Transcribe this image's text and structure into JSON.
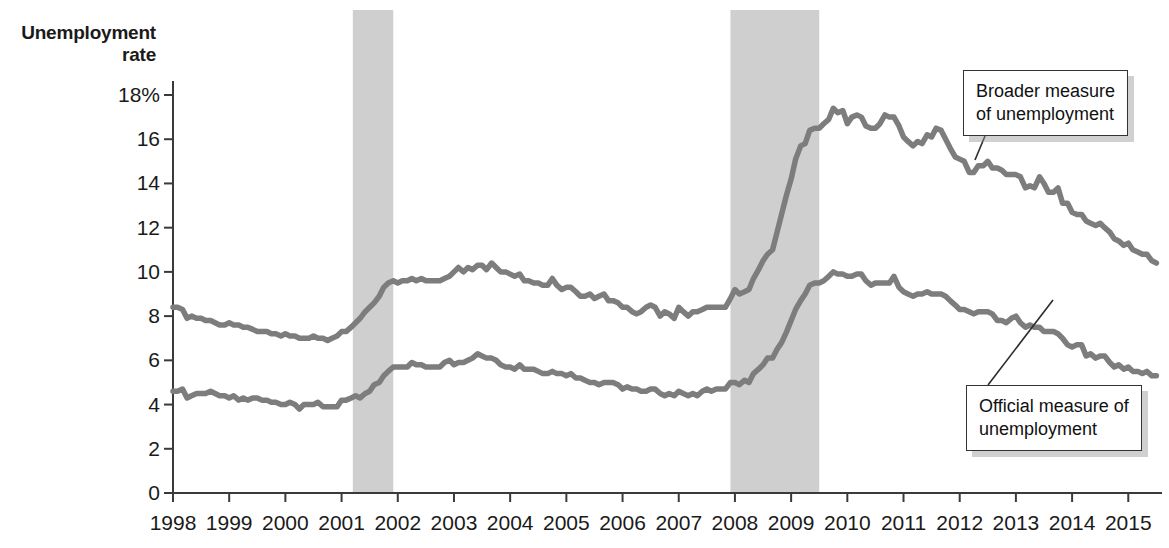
{
  "chart_data": {
    "type": "line",
    "title": "",
    "ylabel": "Unemployment\nrate",
    "xlabel": "",
    "ylim": [
      0,
      18
    ],
    "xlim": [
      1998.0,
      2015.6
    ],
    "grid": false,
    "legend_position": "annotations",
    "y_ticks": [
      "0",
      "2",
      "4",
      "6",
      "8",
      "10",
      "12",
      "14",
      "16",
      "18%"
    ],
    "y_tick_values": [
      0,
      2,
      4,
      6,
      8,
      10,
      12,
      14,
      16,
      18
    ],
    "x_ticks": [
      "1998",
      "1999",
      "2000",
      "2001",
      "2002",
      "2003",
      "2004",
      "2005",
      "2006",
      "2007",
      "2008",
      "2009",
      "2010",
      "2011",
      "2012",
      "2013",
      "2014",
      "2015"
    ],
    "x_tick_values": [
      1998,
      1999,
      2000,
      2001,
      2002,
      2003,
      2004,
      2005,
      2006,
      2007,
      2008,
      2009,
      2010,
      2011,
      2012,
      2013,
      2014,
      2015
    ],
    "line_color": "#7d7d7d",
    "shading_color": "#cfcfcf",
    "axis_color": "#3a3a3a",
    "recession_bands": [
      {
        "start": 2001.2,
        "end": 2001.92,
        "label": "2001 recession"
      },
      {
        "start": 2007.92,
        "end": 2009.5,
        "label": "2007-2009 recession"
      }
    ],
    "annotations": [
      {
        "name": "broader-measure",
        "text": "Broader measure\nof unemployment",
        "box_x": 963,
        "box_y": 70,
        "point_x": 975,
        "point_y": 160
      },
      {
        "name": "official-measure",
        "text": "Official measure of\nunemployment",
        "box_x": 966,
        "box_y": 385,
        "point_x": 1053,
        "point_y": 300
      }
    ],
    "series": [
      {
        "name": "Broader measure of unemployment",
        "x": [
          1998.0,
          1998.08,
          1998.17,
          1998.25,
          1998.33,
          1998.42,
          1998.5,
          1998.58,
          1998.67,
          1998.75,
          1998.83,
          1998.92,
          1999.0,
          1999.08,
          1999.17,
          1999.25,
          1999.33,
          1999.42,
          1999.5,
          1999.58,
          1999.67,
          1999.75,
          1999.83,
          1999.92,
          2000.0,
          2000.08,
          2000.17,
          2000.25,
          2000.33,
          2000.42,
          2000.5,
          2000.58,
          2000.67,
          2000.75,
          2000.83,
          2000.92,
          2001.0,
          2001.08,
          2001.17,
          2001.25,
          2001.33,
          2001.42,
          2001.5,
          2001.58,
          2001.67,
          2001.75,
          2001.83,
          2001.92,
          2002.0,
          2002.08,
          2002.17,
          2002.25,
          2002.33,
          2002.42,
          2002.5,
          2002.58,
          2002.67,
          2002.75,
          2002.83,
          2002.92,
          2003.0,
          2003.08,
          2003.17,
          2003.25,
          2003.33,
          2003.42,
          2003.5,
          2003.58,
          2003.67,
          2003.75,
          2003.83,
          2003.92,
          2004.0,
          2004.08,
          2004.17,
          2004.25,
          2004.33,
          2004.42,
          2004.5,
          2004.58,
          2004.67,
          2004.75,
          2004.83,
          2004.92,
          2005.0,
          2005.08,
          2005.17,
          2005.25,
          2005.33,
          2005.42,
          2005.5,
          2005.58,
          2005.67,
          2005.75,
          2005.83,
          2005.92,
          2006.0,
          2006.08,
          2006.17,
          2006.25,
          2006.33,
          2006.42,
          2006.5,
          2006.58,
          2006.67,
          2006.75,
          2006.83,
          2006.92,
          2007.0,
          2007.08,
          2007.17,
          2007.25,
          2007.33,
          2007.42,
          2007.5,
          2007.58,
          2007.67,
          2007.75,
          2007.83,
          2007.92,
          2008.0,
          2008.08,
          2008.17,
          2008.25,
          2008.33,
          2008.42,
          2008.5,
          2008.58,
          2008.67,
          2008.75,
          2008.83,
          2008.92,
          2009.0,
          2009.08,
          2009.17,
          2009.25,
          2009.33,
          2009.42,
          2009.5,
          2009.58,
          2009.67,
          2009.75,
          2009.83,
          2009.92,
          2010.0,
          2010.08,
          2010.17,
          2010.25,
          2010.33,
          2010.42,
          2010.5,
          2010.58,
          2010.67,
          2010.75,
          2010.83,
          2010.92,
          2011.0,
          2011.08,
          2011.17,
          2011.25,
          2011.33,
          2011.42,
          2011.5,
          2011.58,
          2011.67,
          2011.75,
          2011.83,
          2011.92,
          2012.0,
          2012.08,
          2012.17,
          2012.25,
          2012.33,
          2012.42,
          2012.5,
          2012.58,
          2012.67,
          2012.75,
          2012.83,
          2012.92,
          2013.0,
          2013.08,
          2013.17,
          2013.25,
          2013.33,
          2013.42,
          2013.5,
          2013.58,
          2013.67,
          2013.75,
          2013.83,
          2013.92,
          2014.0,
          2014.08,
          2014.17,
          2014.25,
          2014.33,
          2014.42,
          2014.5,
          2014.58,
          2014.67,
          2014.75,
          2014.83,
          2014.92,
          2015.0,
          2015.08,
          2015.17,
          2015.25,
          2015.33,
          2015.42,
          2015.5
        ],
        "values": [
          8.4,
          8.4,
          8.3,
          7.9,
          8.0,
          7.9,
          7.9,
          7.8,
          7.8,
          7.7,
          7.6,
          7.6,
          7.7,
          7.6,
          7.6,
          7.5,
          7.5,
          7.4,
          7.3,
          7.3,
          7.3,
          7.2,
          7.2,
          7.1,
          7.2,
          7.1,
          7.1,
          7.0,
          7.0,
          7.0,
          7.1,
          7.0,
          7.0,
          6.9,
          7.0,
          7.1,
          7.3,
          7.3,
          7.5,
          7.7,
          7.9,
          8.2,
          8.4,
          8.6,
          8.9,
          9.3,
          9.5,
          9.6,
          9.5,
          9.6,
          9.6,
          9.7,
          9.6,
          9.7,
          9.6,
          9.6,
          9.6,
          9.6,
          9.7,
          9.8,
          10.0,
          10.2,
          10.0,
          10.2,
          10.1,
          10.3,
          10.3,
          10.1,
          10.4,
          10.2,
          10.0,
          10.0,
          9.9,
          9.8,
          9.9,
          9.6,
          9.6,
          9.5,
          9.5,
          9.4,
          9.4,
          9.7,
          9.4,
          9.2,
          9.3,
          9.3,
          9.1,
          8.9,
          8.9,
          9.0,
          8.8,
          8.9,
          9.0,
          8.7,
          8.7,
          8.6,
          8.4,
          8.4,
          8.2,
          8.1,
          8.2,
          8.4,
          8.5,
          8.4,
          8.0,
          8.2,
          8.1,
          7.9,
          8.4,
          8.2,
          8.0,
          8.2,
          8.2,
          8.3,
          8.4,
          8.4,
          8.4,
          8.4,
          8.4,
          8.8,
          9.2,
          9.0,
          9.1,
          9.2,
          9.7,
          10.1,
          10.5,
          10.8,
          11.0,
          11.8,
          12.6,
          13.5,
          14.2,
          15.1,
          15.7,
          15.8,
          16.4,
          16.5,
          16.5,
          16.7,
          16.9,
          17.4,
          17.2,
          17.3,
          16.7,
          17.0,
          17.1,
          17.0,
          16.6,
          16.5,
          16.5,
          16.7,
          17.1,
          17.0,
          17.0,
          16.6,
          16.1,
          15.9,
          15.7,
          15.9,
          15.8,
          16.2,
          16.1,
          16.5,
          16.4,
          16.0,
          15.6,
          15.2,
          15.1,
          15.0,
          14.5,
          14.5,
          14.8,
          14.8,
          15.0,
          14.7,
          14.7,
          14.6,
          14.4,
          14.4,
          14.4,
          14.3,
          13.8,
          13.9,
          13.8,
          14.3,
          14.0,
          13.6,
          13.6,
          13.8,
          13.1,
          13.1,
          12.7,
          12.6,
          12.6,
          12.3,
          12.2,
          12.1,
          12.2,
          12.0,
          11.8,
          11.5,
          11.4,
          11.2,
          11.3,
          11.0,
          10.9,
          10.8,
          10.8,
          10.5,
          10.4
        ]
      },
      {
        "name": "Official measure of unemployment",
        "x": [
          1998.0,
          1998.08,
          1998.17,
          1998.25,
          1998.33,
          1998.42,
          1998.5,
          1998.58,
          1998.67,
          1998.75,
          1998.83,
          1998.92,
          1999.0,
          1999.08,
          1999.17,
          1999.25,
          1999.33,
          1999.42,
          1999.5,
          1999.58,
          1999.67,
          1999.75,
          1999.83,
          1999.92,
          2000.0,
          2000.08,
          2000.17,
          2000.25,
          2000.33,
          2000.42,
          2000.5,
          2000.58,
          2000.67,
          2000.75,
          2000.83,
          2000.92,
          2001.0,
          2001.08,
          2001.17,
          2001.25,
          2001.33,
          2001.42,
          2001.5,
          2001.58,
          2001.67,
          2001.75,
          2001.83,
          2001.92,
          2002.0,
          2002.08,
          2002.17,
          2002.25,
          2002.33,
          2002.42,
          2002.5,
          2002.58,
          2002.67,
          2002.75,
          2002.83,
          2002.92,
          2003.0,
          2003.08,
          2003.17,
          2003.25,
          2003.33,
          2003.42,
          2003.5,
          2003.58,
          2003.67,
          2003.75,
          2003.83,
          2003.92,
          2004.0,
          2004.08,
          2004.17,
          2004.25,
          2004.33,
          2004.42,
          2004.5,
          2004.58,
          2004.67,
          2004.75,
          2004.83,
          2004.92,
          2005.0,
          2005.08,
          2005.17,
          2005.25,
          2005.33,
          2005.42,
          2005.5,
          2005.58,
          2005.67,
          2005.75,
          2005.83,
          2005.92,
          2006.0,
          2006.08,
          2006.17,
          2006.25,
          2006.33,
          2006.42,
          2006.5,
          2006.58,
          2006.67,
          2006.75,
          2006.83,
          2006.92,
          2007.0,
          2007.08,
          2007.17,
          2007.25,
          2007.33,
          2007.42,
          2007.5,
          2007.58,
          2007.67,
          2007.75,
          2007.83,
          2007.92,
          2008.0,
          2008.08,
          2008.17,
          2008.25,
          2008.33,
          2008.42,
          2008.5,
          2008.58,
          2008.67,
          2008.75,
          2008.83,
          2008.92,
          2009.0,
          2009.08,
          2009.17,
          2009.25,
          2009.33,
          2009.42,
          2009.5,
          2009.58,
          2009.67,
          2009.75,
          2009.83,
          2009.92,
          2010.0,
          2010.08,
          2010.17,
          2010.25,
          2010.33,
          2010.42,
          2010.5,
          2010.58,
          2010.67,
          2010.75,
          2010.83,
          2010.92,
          2011.0,
          2011.08,
          2011.17,
          2011.25,
          2011.33,
          2011.42,
          2011.5,
          2011.58,
          2011.67,
          2011.75,
          2011.83,
          2011.92,
          2012.0,
          2012.08,
          2012.17,
          2012.25,
          2012.33,
          2012.42,
          2012.5,
          2012.58,
          2012.67,
          2012.75,
          2012.83,
          2012.92,
          2013.0,
          2013.08,
          2013.17,
          2013.25,
          2013.33,
          2013.42,
          2013.5,
          2013.58,
          2013.67,
          2013.75,
          2013.83,
          2013.92,
          2014.0,
          2014.08,
          2014.17,
          2014.25,
          2014.33,
          2014.42,
          2014.5,
          2014.58,
          2014.67,
          2014.75,
          2014.83,
          2014.92,
          2015.0,
          2015.08,
          2015.17,
          2015.25,
          2015.33,
          2015.42,
          2015.5
        ],
        "values": [
          4.6,
          4.6,
          4.7,
          4.3,
          4.4,
          4.5,
          4.5,
          4.5,
          4.6,
          4.5,
          4.4,
          4.4,
          4.3,
          4.4,
          4.2,
          4.3,
          4.2,
          4.3,
          4.3,
          4.2,
          4.2,
          4.1,
          4.1,
          4.0,
          4.0,
          4.1,
          4.0,
          3.8,
          4.0,
          4.0,
          4.0,
          4.1,
          3.9,
          3.9,
          3.9,
          3.9,
          4.2,
          4.2,
          4.3,
          4.4,
          4.3,
          4.5,
          4.6,
          4.9,
          5.0,
          5.3,
          5.5,
          5.7,
          5.7,
          5.7,
          5.7,
          5.9,
          5.8,
          5.8,
          5.7,
          5.7,
          5.7,
          5.7,
          5.9,
          6.0,
          5.8,
          5.9,
          5.9,
          6.0,
          6.1,
          6.3,
          6.2,
          6.1,
          6.1,
          6.0,
          5.8,
          5.7,
          5.7,
          5.6,
          5.8,
          5.6,
          5.6,
          5.6,
          5.5,
          5.4,
          5.4,
          5.5,
          5.4,
          5.4,
          5.3,
          5.4,
          5.2,
          5.2,
          5.1,
          5.0,
          5.0,
          4.9,
          5.0,
          5.0,
          5.0,
          4.9,
          4.7,
          4.8,
          4.7,
          4.7,
          4.6,
          4.6,
          4.7,
          4.7,
          4.5,
          4.4,
          4.5,
          4.4,
          4.6,
          4.5,
          4.4,
          4.5,
          4.4,
          4.6,
          4.7,
          4.6,
          4.7,
          4.7,
          4.7,
          5.0,
          5.0,
          4.9,
          5.1,
          5.0,
          5.4,
          5.6,
          5.8,
          6.1,
          6.1,
          6.5,
          6.8,
          7.3,
          7.8,
          8.3,
          8.7,
          9.0,
          9.4,
          9.5,
          9.5,
          9.6,
          9.8,
          10.0,
          9.9,
          9.9,
          9.8,
          9.8,
          9.9,
          9.9,
          9.6,
          9.4,
          9.5,
          9.5,
          9.5,
          9.5,
          9.8,
          9.3,
          9.1,
          9.0,
          8.9,
          9.0,
          9.0,
          9.1,
          9.0,
          9.0,
          9.0,
          8.9,
          8.7,
          8.5,
          8.3,
          8.3,
          8.2,
          8.1,
          8.2,
          8.2,
          8.2,
          8.1,
          7.8,
          7.8,
          7.7,
          7.9,
          8.0,
          7.7,
          7.5,
          7.6,
          7.5,
          7.5,
          7.3,
          7.3,
          7.3,
          7.2,
          7.0,
          6.7,
          6.6,
          6.7,
          6.7,
          6.2,
          6.3,
          6.1,
          6.2,
          6.2,
          5.9,
          5.7,
          5.8,
          5.6,
          5.7,
          5.5,
          5.5,
          5.4,
          5.5,
          5.3,
          5.3
        ]
      }
    ]
  }
}
